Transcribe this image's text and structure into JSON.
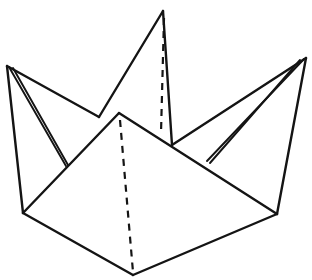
{
  "figure": {
    "canvas": {
      "width": 312,
      "height": 280,
      "background": "#ffffff"
    },
    "style": {
      "line_color": "#141414",
      "fill_color": "#ffffff",
      "solid_stroke_width": 2.4,
      "thin_stroke_width": 1.9,
      "dashed_stroke_width": 2.2,
      "dash_pattern": "7 6"
    },
    "points": {
      "left_peak": {
        "x": 7,
        "y": 66,
        "label": "left point apex"
      },
      "center_peak": {
        "x": 163,
        "y": 11,
        "label": "center point apex"
      },
      "right_peak": {
        "x": 306,
        "y": 58,
        "label": "right point apex"
      },
      "front_apex": {
        "x": 119,
        "y": 113,
        "label": "front flap apex"
      },
      "bottom_left": {
        "x": 23,
        "y": 213,
        "label": "lower left corner"
      },
      "bottom_right": {
        "x": 277,
        "y": 214,
        "label": "lower right corner"
      },
      "bottom_center": {
        "x": 133,
        "y": 275,
        "label": "bottom center corner"
      },
      "left_inner_join": {
        "x": 99,
        "y": 117,
        "label": "left rear edge meeting front flap"
      },
      "right_inner_join": {
        "x": 172,
        "y": 145,
        "label": "right rear edge meeting front flap"
      },
      "center_base_left": {
        "x": 99,
        "y": 117,
        "label": "center point left base"
      },
      "center_base_right": {
        "x": 172,
        "y": 145,
        "label": "center point right base"
      },
      "left_sliver_tip": {
        "x": 66,
        "y": 166,
        "label": "left narrow sliver tip"
      },
      "right_sliver_tip": {
        "x": 207,
        "y": 161,
        "label": "right narrow sliver tip"
      }
    },
    "shapes": [
      {
        "name": "left-point-face",
        "kind": "polygon",
        "points": "7,66 99,117 23,213"
      },
      {
        "name": "center-point-face",
        "kind": "polygon",
        "points": "163,11 172,145 99,117"
      },
      {
        "name": "right-point-face",
        "kind": "polygon",
        "points": "306,58 277,214 172,145"
      },
      {
        "name": "front-flap-face",
        "kind": "polygon",
        "points": "119,113 277,214 133,275 23,213"
      }
    ],
    "solid_edges": [
      {
        "name": "left-peak-to-bottom-left",
        "d": "M 7,66 L 23,213"
      },
      {
        "name": "left-peak-to-inner-join",
        "d": "M 7,66 L 99,117"
      },
      {
        "name": "left-sliver-outer",
        "d": "M 9,67 L 66,166"
      },
      {
        "name": "left-sliver-inner",
        "d": "M 13,68 L 68,165"
      },
      {
        "name": "center-peak-left-edge",
        "d": "M 163,11 L 99,117"
      },
      {
        "name": "center-peak-right-edge",
        "d": "M 163,11 L 172,145"
      },
      {
        "name": "right-peak-to-bottom-right",
        "d": "M 306,58 L 277,214"
      },
      {
        "name": "right-peak-to-inner-join",
        "d": "M 306,58 L 172,145"
      },
      {
        "name": "right-sliver-outer",
        "d": "M 304,59 L 207,161"
      },
      {
        "name": "right-sliver-inner",
        "d": "M 300,60 L 210,163"
      },
      {
        "name": "front-flap-left-edge",
        "d": "M 119,113 L 23,213"
      },
      {
        "name": "front-flap-right-edge",
        "d": "M 119,113 L 277,214"
      },
      {
        "name": "bottom-left-edge",
        "d": "M 23,213 L 133,275"
      },
      {
        "name": "bottom-right-edge",
        "d": "M 133,275 L 277,214"
      }
    ],
    "dashed_edges": [
      {
        "name": "center-point-center-crease",
        "d": "M 164,18 L 161,133"
      },
      {
        "name": "front-flap-center-crease",
        "d": "M 120,120 L 133,272"
      }
    ]
  }
}
